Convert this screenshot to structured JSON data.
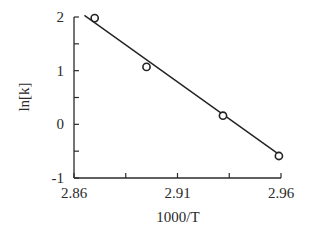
{
  "chart_data": {
    "type": "scatter",
    "title": "",
    "xlabel": "1000/T",
    "ylabel": "ln[k]",
    "xlim": [
      2.86,
      2.96
    ],
    "ylim": [
      -1,
      2
    ],
    "x_ticks": [
      {
        "value": 2.86,
        "label": "2.86"
      },
      {
        "value": 2.885,
        "label": ""
      },
      {
        "value": 2.91,
        "label": "2.91"
      },
      {
        "value": 2.935,
        "label": ""
      },
      {
        "value": 2.96,
        "label": "2.96"
      }
    ],
    "y_ticks": [
      {
        "value": -1,
        "label": "-1"
      },
      {
        "value": -0.5,
        "label": ""
      },
      {
        "value": 0,
        "label": "0"
      },
      {
        "value": 0.5,
        "label": ""
      },
      {
        "value": 1,
        "label": "1"
      },
      {
        "value": 1.5,
        "label": ""
      },
      {
        "value": 2,
        "label": "2"
      }
    ],
    "grid": false,
    "legend": null,
    "series": [
      {
        "name": "data",
        "type": "scatter",
        "marker": "open-circle",
        "x": [
          2.87,
          2.895,
          2.932,
          2.959
        ],
        "y": [
          1.98,
          1.07,
          0.16,
          -0.59
        ]
      },
      {
        "name": "linear fit",
        "type": "line",
        "x": [
          2.865,
          2.959
        ],
        "y": [
          2.03,
          -0.56
        ]
      }
    ]
  },
  "axes": {
    "x_title": "1000/T",
    "y_title": "ln[k]"
  },
  "colors": {
    "ink": "#222222",
    "background": "#ffffff"
  }
}
